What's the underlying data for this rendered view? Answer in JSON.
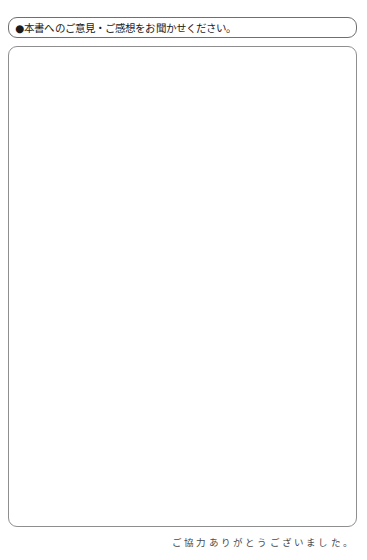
{
  "page": {
    "background_color": "#ffffff",
    "width": 367,
    "height": 560
  },
  "prompt": {
    "bullet": "●",
    "text": "●本書へのご意見・ご感想をお聞かせください。",
    "border_color": "#6f6f6f"
  },
  "answer_area": {
    "placeholder": "",
    "value": "",
    "border_color": "#8f8f8f"
  },
  "footer": {
    "thanks_text": "ご協力ありがとうございました。",
    "color": "#4a4a4a"
  }
}
